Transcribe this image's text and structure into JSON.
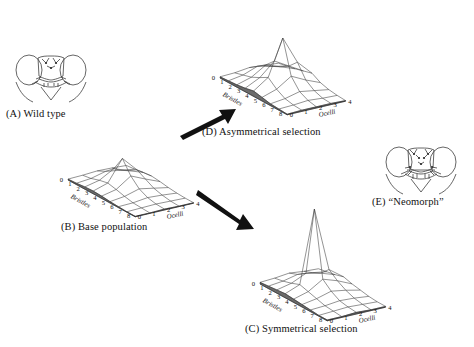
{
  "figure": {
    "kind": "scientific-figure",
    "background": "#ffffff",
    "ink": "#111111",
    "mesh_color": "#3a3a3a",
    "wall_color": "#6b6b6b"
  },
  "panels": {
    "a": {
      "label": "(A) Wild type",
      "icon": "fly-head-wild-type"
    },
    "b": {
      "label": "(B) Base population",
      "icon": "surface-plot"
    },
    "c": {
      "label": "(C) Symmetrical selection",
      "icon": "surface-plot"
    },
    "d": {
      "label": "(D) Asymmetrical selection",
      "icon": "surface-plot"
    },
    "e": {
      "label": "(E) “Neomorph”",
      "icon": "fly-head-neomorph"
    }
  },
  "arrows": {
    "b_to_d": {
      "name": "arrow-up-right",
      "from": "B",
      "to": "D"
    },
    "b_to_c": {
      "name": "arrow-down-right",
      "from": "B",
      "to": "C"
    }
  },
  "axes": {
    "x_label": "Bristles",
    "y_label": "Ocelli",
    "x_ticks": [
      "0",
      "1",
      "2",
      "3",
      "4",
      "5",
      "6",
      "7",
      "8"
    ],
    "y_ticks": [
      "0",
      "1",
      "2",
      "3",
      "4"
    ]
  },
  "chart_data": [
    {
      "type": "surface",
      "panel": "B",
      "title": "(B) Base population",
      "xlabel": "Bristles",
      "ylabel": "Ocelli",
      "zlabel": "",
      "x": [
        0,
        1,
        2,
        3,
        4,
        5,
        6,
        7,
        8
      ],
      "y": [
        0,
        1,
        2,
        3,
        4
      ],
      "grid": true,
      "legend": "none",
      "zlim": [
        0,
        100
      ],
      "z": [
        [
          2,
          3,
          5,
          6,
          5,
          3,
          2,
          1,
          1
        ],
        [
          3,
          6,
          12,
          16,
          12,
          7,
          3,
          2,
          1
        ],
        [
          5,
          14,
          30,
          62,
          34,
          16,
          7,
          3,
          2
        ],
        [
          4,
          9,
          18,
          30,
          20,
          10,
          5,
          2,
          1
        ],
        [
          2,
          4,
          7,
          9,
          7,
          4,
          2,
          1,
          1
        ]
      ]
    },
    {
      "type": "surface",
      "panel": "D",
      "title": "(D) Asymmetrical selection",
      "xlabel": "Bristles",
      "ylabel": "Ocelli",
      "zlabel": "",
      "x": [
        0,
        1,
        2,
        3,
        4,
        5,
        6,
        7,
        8
      ],
      "y": [
        0,
        1,
        2,
        3,
        4
      ],
      "grid": true,
      "legend": "none",
      "zlim": [
        0,
        100
      ],
      "z": [
        [
          2,
          3,
          4,
          6,
          9,
          6,
          3,
          2,
          1
        ],
        [
          3,
          7,
          11,
          18,
          26,
          14,
          6,
          3,
          2
        ],
        [
          6,
          16,
          26,
          40,
          86,
          30,
          12,
          5,
          2
        ],
        [
          4,
          10,
          17,
          26,
          40,
          18,
          8,
          3,
          2
        ],
        [
          2,
          5,
          8,
          12,
          16,
          8,
          4,
          2,
          1
        ]
      ]
    },
    {
      "type": "surface",
      "panel": "C",
      "title": "(C) Symmetrical selection",
      "xlabel": "Bristles",
      "ylabel": "Ocelli",
      "zlabel": "",
      "x": [
        0,
        1,
        2,
        3,
        4,
        5,
        6,
        7,
        8
      ],
      "y": [
        0,
        1,
        2,
        3,
        4
      ],
      "grid": true,
      "legend": "none",
      "zlim": [
        0,
        100
      ],
      "z": [
        [
          2,
          3,
          4,
          5,
          4,
          3,
          2,
          1,
          1
        ],
        [
          3,
          5,
          8,
          12,
          9,
          6,
          3,
          2,
          1
        ],
        [
          5,
          9,
          16,
          100,
          20,
          11,
          5,
          3,
          2
        ],
        [
          3,
          7,
          12,
          22,
          14,
          8,
          4,
          2,
          1
        ],
        [
          2,
          4,
          6,
          9,
          6,
          4,
          2,
          1,
          1
        ]
      ]
    }
  ]
}
